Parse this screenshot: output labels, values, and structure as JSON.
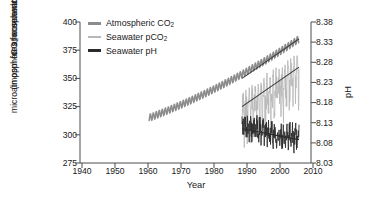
{
  "chart_data": {
    "type": "line",
    "title": "",
    "xlabel": "Year",
    "ylabel_left_line1": "CO2 concentration",
    "ylabel_left_line2": "(in ppm for atmospheric CO2 or microatmospheres for seawater CO2)",
    "ylabel_right": "pH",
    "xlim": [
      1935,
      2012
    ],
    "ylim_left": [
      275,
      400
    ],
    "ylim_right": [
      8.03,
      8.38
    ],
    "xticks": [
      1940,
      1950,
      1960,
      1970,
      1980,
      1990,
      2000,
      2010
    ],
    "yticks_left": [
      275,
      300,
      325,
      350,
      375,
      400
    ],
    "yticks_right": [
      "8.03",
      "8.08",
      "8.13",
      "8.18",
      "8.23",
      "8.28",
      "8.33",
      "8.38"
    ],
    "grid": false,
    "legend_position": "top-left",
    "colors": {
      "atmospheric_co2": "#8c8c8c",
      "seawater_pco2": "#b8b8b8",
      "seawater_ph": "#2b2b2b",
      "trendline": "#3a3a3a",
      "axis": "#4d4d4d"
    },
    "series": [
      {
        "name": "Atmospheric CO2",
        "axis": "left",
        "units": "ppm",
        "x_start": 1958,
        "x_end": 2008,
        "y_start": 315,
        "y_end": 385,
        "seasonal_amplitude": 3.0,
        "note": "Mauna Loa monthly record with seasonal cycle, rising trend"
      },
      {
        "name": "Seawater pCO2",
        "axis": "left",
        "units": "microatmospheres",
        "x_start": 1989,
        "x_end": 2008,
        "y_start": 325,
        "y_end": 360,
        "variability": 30,
        "note": "Station ALOHA seawater pCO2, high scatter, rising trend"
      },
      {
        "name": "Seawater pH",
        "axis": "right",
        "units": "pH",
        "x_start": 1989,
        "x_end": 2008,
        "y_start": 8.12,
        "y_end": 8.09,
        "variability": 0.03,
        "note": "Seawater pH declining slowly, scattered monthly values"
      }
    ],
    "trendlines": [
      {
        "for": "Atmospheric CO2",
        "axis": "left",
        "x": [
          1989,
          2008
        ],
        "y": [
          350,
          385
        ]
      },
      {
        "for": "Seawater pCO2",
        "axis": "left",
        "x": [
          1989,
          2008
        ],
        "y": [
          325,
          360
        ]
      },
      {
        "for": "Seawater pH",
        "axis": "right",
        "x": [
          1989,
          2008
        ],
        "y": [
          8.115,
          8.088
        ]
      }
    ]
  },
  "legend": {
    "items": [
      {
        "label_pre": "Atmospheric CO",
        "label_sub": "2",
        "label_post": "",
        "color": "#8c8c8c"
      },
      {
        "label_pre": "Seawater pCO",
        "label_sub": "2",
        "label_post": "",
        "color": "#b8b8b8"
      },
      {
        "label_pre": "Seawater pH",
        "label_sub": "",
        "label_post": "",
        "color": "#2b2b2b"
      }
    ]
  },
  "axes": {
    "xlabel": "Year",
    "ylabel_right": "pH",
    "ylabel_left_part1_pre": "CO",
    "ylabel_left_part1_sub": "2",
    "ylabel_left_part1_post": " concentration",
    "ylabel_left_part2_a": "(in ppm for atmospheric CO",
    "ylabel_left_part2_sub1": "2",
    "ylabel_left_part2_b": " or",
    "ylabel_left_part3_a": "microatmospheres for seawater CO",
    "ylabel_left_part3_sub": "2",
    "ylabel_left_part3_b": ")",
    "xticks": [
      "1940",
      "1950",
      "1960",
      "1970",
      "1980",
      "1990",
      "2000",
      "2010"
    ],
    "yticks_left": [
      "400",
      "375",
      "350",
      "325",
      "300",
      "275"
    ],
    "yticks_right": [
      "8.38",
      "8.33",
      "8.28",
      "8.23",
      "8.18",
      "8.13",
      "8.08",
      "8.03"
    ]
  }
}
